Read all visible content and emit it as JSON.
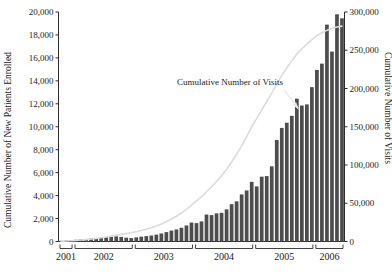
{
  "chart_data": {
    "type": "bar",
    "title": "",
    "annotation": "Cumulative Number of Visits",
    "ylabel_left": "Cumulative Number of New Patients Enrolled",
    "ylabel_right": "Cumulative Number of Visits",
    "xlabel": "",
    "grid": false,
    "legend_position": "none",
    "ylim_left": [
      0,
      20000
    ],
    "ylim_right": [
      0,
      300000
    ],
    "yticks_left": [
      "0",
      "2,000",
      "4,000",
      "6,000",
      "8,000",
      "10,000",
      "12,000",
      "14,000",
      "16,000",
      "18,000",
      "20,000"
    ],
    "yticks_left_values": [
      0,
      2000,
      4000,
      6000,
      8000,
      10000,
      12000,
      14000,
      16000,
      18000,
      20000
    ],
    "yticks_right": [
      "0",
      "50,000",
      "100,000",
      "150,000",
      "200,000",
      "250,000",
      "300,000"
    ],
    "yticks_right_values": [
      0,
      50000,
      100000,
      150000,
      200000,
      250000,
      300000
    ],
    "xticks": [
      "2001",
      "2002",
      "2003",
      "2004",
      "2005",
      "2006"
    ],
    "x_groups": [
      {
        "label": "2001",
        "count": 3
      },
      {
        "label": "2002",
        "count": 12
      },
      {
        "label": "2003",
        "count": 12
      },
      {
        "label": "2004",
        "count": 12
      },
      {
        "label": "2005",
        "count": 12
      },
      {
        "label": "2006",
        "count": 6
      }
    ],
    "categories": [
      "2001-10",
      "2001-11",
      "2001-12",
      "2002-01",
      "2002-02",
      "2002-03",
      "2002-04",
      "2002-05",
      "2002-06",
      "2002-07",
      "2002-08",
      "2002-09",
      "2002-10",
      "2002-11",
      "2002-12",
      "2003-01",
      "2003-02",
      "2003-03",
      "2003-04",
      "2003-05",
      "2003-06",
      "2003-07",
      "2003-08",
      "2003-09",
      "2003-10",
      "2003-11",
      "2003-12",
      "2004-01",
      "2004-02",
      "2004-03",
      "2004-04",
      "2004-05",
      "2004-06",
      "2004-07",
      "2004-08",
      "2004-09",
      "2004-10",
      "2004-11",
      "2004-12",
      "2005-01",
      "2005-02",
      "2005-03",
      "2005-04",
      "2005-05",
      "2005-06",
      "2005-07",
      "2005-08",
      "2005-09",
      "2005-10",
      "2005-11",
      "2005-12",
      "2006-01",
      "2006-02",
      "2006-03",
      "2006-04",
      "2006-05",
      "2006-06"
    ],
    "series": [
      {
        "name": "Cumulative Number of New Patients Enrolled",
        "axis": "left",
        "type": "bar",
        "values": [
          60,
          90,
          110,
          150,
          180,
          220,
          260,
          300,
          340,
          380,
          420,
          450,
          400,
          330,
          300,
          360,
          420,
          470,
          520,
          600,
          700,
          820,
          950,
          1050,
          1200,
          1400,
          1650,
          1600,
          1750,
          2350,
          2300,
          2450,
          2500,
          2800,
          3250,
          3500,
          4100,
          4450,
          5200,
          4800,
          5650,
          5700,
          6550,
          8850,
          9900,
          10350,
          10950,
          12450,
          11850,
          11950,
          13450,
          14950,
          15500,
          18900,
          16550,
          19800,
          19450
        ]
      },
      {
        "name": "Cumulative Number of Visits",
        "axis": "right",
        "type": "line",
        "values": [
          300,
          600,
          900,
          1400,
          1900,
          2500,
          3200,
          4000,
          4900,
          5900,
          7000,
          8200,
          9300,
          10300,
          11400,
          12800,
          14300,
          16000,
          17900,
          20200,
          22800,
          25900,
          29400,
          33000,
          37200,
          42000,
          47500,
          53000,
          58500,
          65000,
          71500,
          78500,
          86000,
          94500,
          104000,
          114000,
          125000,
          137000,
          150000,
          161000,
          172000,
          183000,
          194000,
          206000,
          217000,
          227000,
          236000,
          245000,
          252000,
          258000,
          264000,
          269000,
          273000,
          276000,
          278500,
          280500,
          281500
        ]
      }
    ]
  }
}
